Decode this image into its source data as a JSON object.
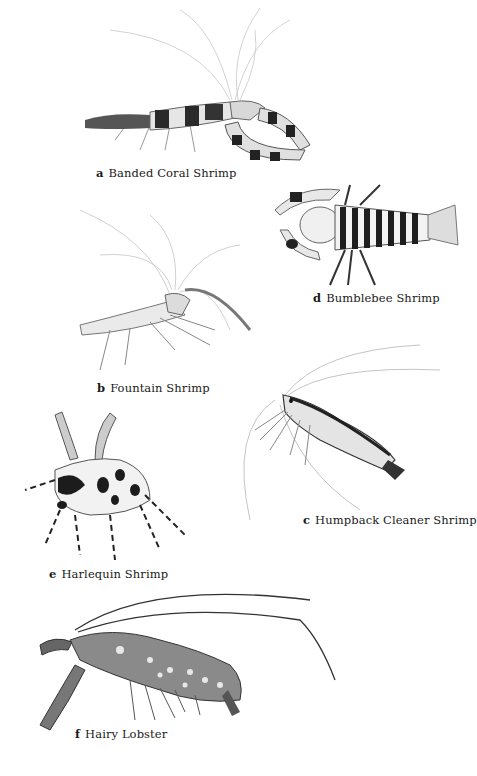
{
  "plate": {
    "background": "#ffffff",
    "ink_color": "#1a1a1a",
    "illustrations": [
      {
        "letter": "a",
        "name": "Banded Coral Shrimp"
      },
      {
        "letter": "d",
        "name": "Bumblebee Shrimp"
      },
      {
        "letter": "b",
        "name": "Fountain Shrimp"
      },
      {
        "letter": "c",
        "name": "Humpback Cleaner Shrimp"
      },
      {
        "letter": "e",
        "name": "Harlequin Shrimp"
      },
      {
        "letter": "f",
        "name": "Hairy Lobster"
      }
    ]
  }
}
